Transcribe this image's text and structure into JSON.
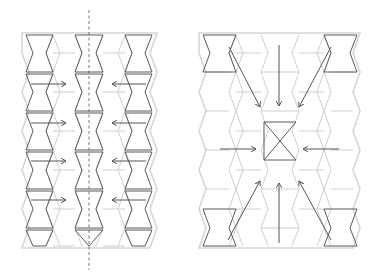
{
  "figure": {
    "left_panel": {
      "label": "Parallel compression pattern with symmetry axis",
      "arrow_rows_y": [
        84,
        123,
        161,
        200
      ],
      "arrow_color": "#555555"
    },
    "right_panel": {
      "label": "Radial compression toward central cell",
      "arrow_color": "#555555"
    },
    "colors": {
      "background": "#ffffff",
      "highlight_cell": "#5a5a5a",
      "grid_lines": "#cfcfcf",
      "symmetry_axis": "#555555"
    }
  }
}
